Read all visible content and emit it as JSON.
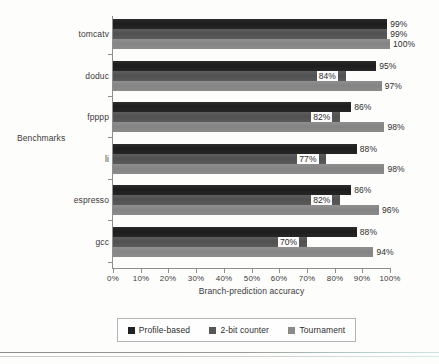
{
  "chart_data": {
    "type": "bar",
    "orientation": "horizontal",
    "title": "",
    "xlabel": "Branch-prediction accuracy",
    "ylabel": "Benchmarks",
    "xlim": [
      0,
      100
    ],
    "grid": false,
    "legend_position": "bottom",
    "categories": [
      "tomcatv",
      "doduc",
      "fpppp",
      "li",
      "espresso",
      "gcc"
    ],
    "xtick_labels": [
      "0%",
      "10%",
      "20%",
      "30%",
      "40%",
      "50%",
      "60%",
      "70%",
      "80%",
      "90%",
      "100%"
    ],
    "xtick_values": [
      0,
      10,
      20,
      30,
      40,
      50,
      60,
      70,
      80,
      90,
      100
    ],
    "series": [
      {
        "name": "Profile-based",
        "color": "#222222",
        "values": [
          99,
          95,
          86,
          88,
          86,
          88
        ],
        "labels": [
          "99%",
          "95%",
          "86%",
          "88%",
          "86%",
          "88%"
        ]
      },
      {
        "name": "2-bit counter",
        "color": "#565656",
        "values": [
          99,
          84,
          82,
          77,
          82,
          70
        ],
        "labels": [
          "99%",
          "84%",
          "82%",
          "77%",
          "82%",
          "70%"
        ]
      },
      {
        "name": "Tournament",
        "color": "#8a8a8a",
        "values": [
          100,
          97,
          98,
          98,
          96,
          94
        ],
        "labels": [
          "100%",
          "97%",
          "98%",
          "98%",
          "96%",
          "94%"
        ]
      }
    ]
  },
  "legend": {
    "items": [
      {
        "label": "Profile-based"
      },
      {
        "label": "2-bit counter"
      },
      {
        "label": "Tournament"
      }
    ]
  }
}
